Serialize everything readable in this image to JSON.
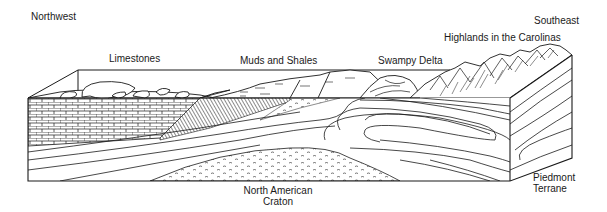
{
  "diagram": {
    "type": "geologic-block-diagram",
    "orientation": {
      "left": "Northwest",
      "right": "Southeast"
    },
    "surface_labels": [
      "Limestones",
      "Muds and Shales",
      "Swampy Delta",
      "Highlands in the Carolinas"
    ],
    "subsurface_labels": [
      "North American Craton",
      "Piedmont Terrane"
    ],
    "labels": {
      "northwest": "Northwest",
      "southeast": "Southeast",
      "limestones": "Limestones",
      "muds_shales": "Muds and Shales",
      "swampy_delta": "Swampy Delta",
      "highlands": "Highlands in the Carolinas",
      "craton_line1": "North American",
      "craton_line2": "Craton",
      "piedmont_line1": "Piedmont",
      "piedmont_line2": "Terrane"
    },
    "colors": {
      "ink": "#1a1a1a",
      "paper": "#ffffff"
    }
  }
}
